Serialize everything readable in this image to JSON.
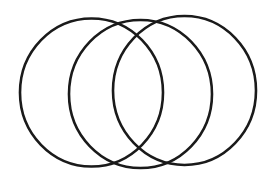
{
  "diagram": {
    "type": "venn",
    "background": "#ffffff",
    "stroke_color": "#1a1a1a",
    "stroke_width": 2.6,
    "shapes": [
      {
        "name": "circle-left",
        "cx": 91.5,
        "cy": 92.5,
        "rx": 71.5,
        "ry": 74
      },
      {
        "name": "circle-middle",
        "cx": 140.5,
        "cy": 94,
        "rx": 71.5,
        "ry": 74
      },
      {
        "name": "circle-right",
        "cx": 184.5,
        "cy": 90.5,
        "rx": 71.5,
        "ry": 74.5
      }
    ]
  }
}
